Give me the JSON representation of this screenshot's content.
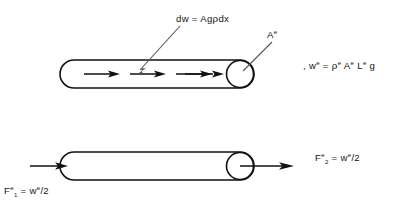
{
  "figure": {
    "title_text": "",
    "background_color": "#ffffff",
    "ink_color": "#111111",
    "leader_color": "#555555"
  },
  "labels": {
    "distributed_load": {
      "full_text": "dw = Agρdx",
      "lhs": "dw",
      "equals": "=",
      "rhs_prefix": "Ag",
      "rho": "ρ",
      "rhs_suffix": "dx"
    },
    "area_callout": {
      "base": "A",
      "superscript": "e"
    },
    "total_weight": {
      "leading_comma": ",",
      "w_base": "w",
      "w_sup": "e",
      "equals": "=",
      "rho": "ρ",
      "rho_sup": "e",
      "area_base": "A",
      "area_sup": "e",
      "length_base": "L",
      "length_sup": "e",
      "gravity": "g"
    },
    "force_left": {
      "f_base": "F",
      "f_sub": "1",
      "f_sup": "e",
      "equals": "=",
      "w_base": "w",
      "w_sup": "e",
      "divisor": "/2"
    },
    "force_right": {
      "f_base": "F",
      "f_sub": "2",
      "f_sup": "e",
      "equals": "=",
      "w_base": "w",
      "w_sup": "e",
      "divisor": "/2"
    }
  },
  "top_element": {
    "name": "pipe-element-distributed-load",
    "internal_arrow_count": 4,
    "description_role": "element with distributed self weight"
  },
  "bottom_element": {
    "name": "pipe-element-equivalent-nodal-forces",
    "external_arrow_count": 2,
    "description_role": "element with equivalent end forces"
  }
}
